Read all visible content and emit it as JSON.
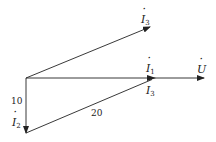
{
  "diagram": {
    "type": "phasor-diagram",
    "phasors": [
      {
        "name": "U",
        "label": "U",
        "dot": true,
        "from": [
          26,
          78
        ],
        "to": [
          205,
          78
        ]
      },
      {
        "name": "I1",
        "label": "I",
        "subscript": "1",
        "dot": true,
        "from": [
          26,
          78
        ],
        "to": [
          155,
          78
        ]
      },
      {
        "name": "I3_upper",
        "label": "I",
        "subscript": "3",
        "dot": true,
        "from": [
          26,
          78
        ],
        "to": [
          150,
          27
        ]
      },
      {
        "name": "I2",
        "label": "I",
        "subscript": "2",
        "dot": true,
        "from": [
          26,
          78
        ],
        "to": [
          26,
          133
        ]
      },
      {
        "name": "I3_lower",
        "label": "I",
        "subscript": "3",
        "dot": true,
        "from": [
          26,
          133
        ],
        "to": [
          155,
          78
        ]
      }
    ],
    "magnitudes": {
      "I2": "10",
      "I3": "20"
    },
    "labels": {
      "u": "U",
      "i": "I",
      "sub1": "1",
      "sub2": "2",
      "sub3": "3",
      "mag_i2": "10",
      "mag_i3": "20"
    }
  }
}
